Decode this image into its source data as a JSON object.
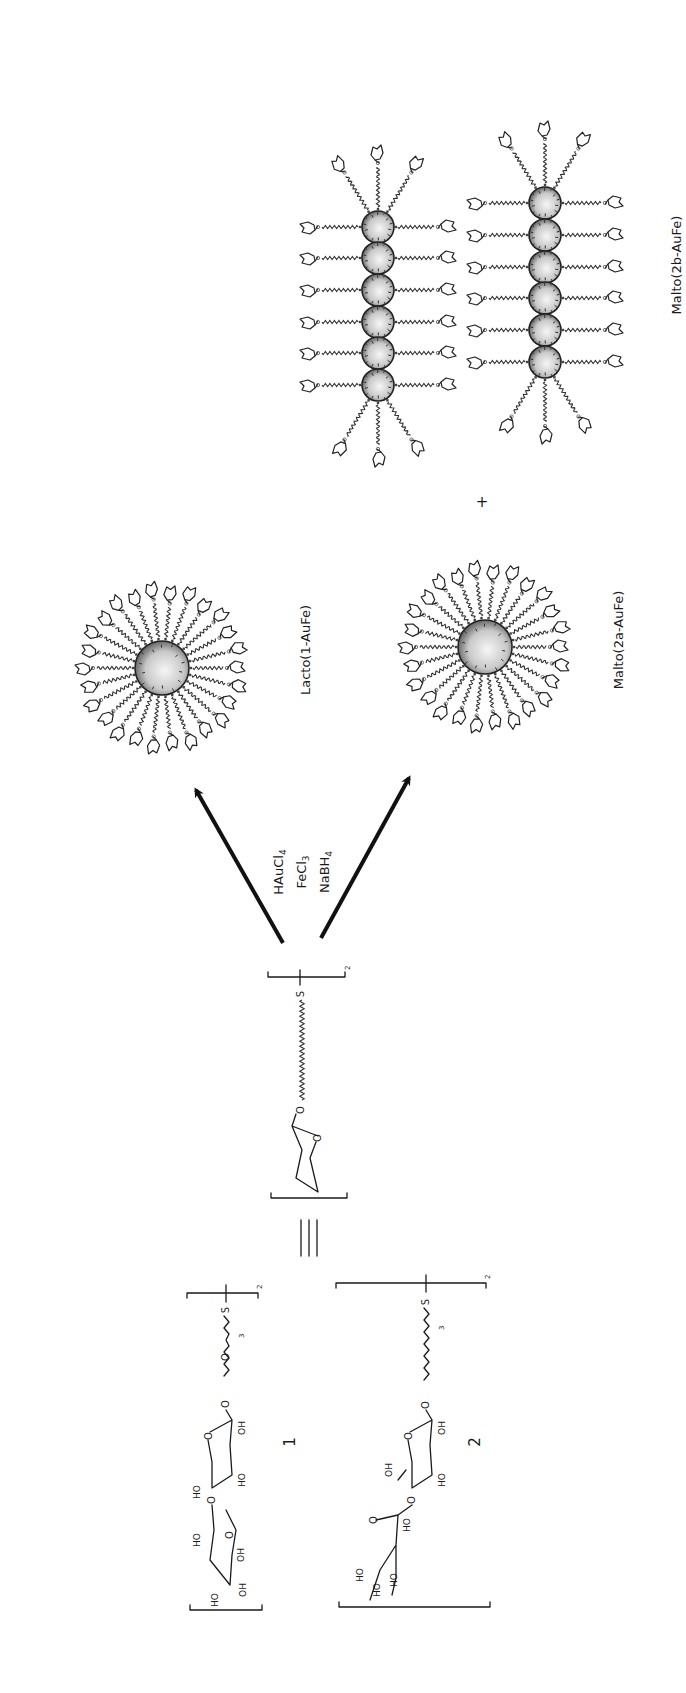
{
  "figure": {
    "orientation": "rotated-90-ccw",
    "reagents": [
      "HAuCl",
      "FeCl",
      "NaBH"
    ],
    "reagent_subscripts": [
      "4",
      "3",
      "4"
    ],
    "equivalence_symbol": "≡",
    "plus_sign": "+",
    "ligand_repeat_subscript": "2",
    "sulfur_atom": "S",
    "oxygen_atom": "O"
  },
  "compounds": [
    {
      "id": "1",
      "label": "1",
      "repeat_subscript": "3",
      "linker": "O-(CH2CH2O)3-CH2CH2-S",
      "sugar": "lactose",
      "hydroxyls": [
        "HO",
        "OH",
        "OH",
        "HO",
        "HO",
        "OH",
        "HO",
        "OH"
      ]
    },
    {
      "id": "2",
      "label": "2",
      "repeat_subscript": "3",
      "linker": "O-(CH2)n-S",
      "sugar": "maltose",
      "hydroxyls": [
        "HO",
        "HO",
        "HO",
        "HO",
        "OH",
        "HO",
        "OH"
      ]
    }
  ],
  "products": [
    {
      "id": "lacto",
      "label": "Lacto(1-AuFe)",
      "type": "single-nanoparticle"
    },
    {
      "id": "malto-2a",
      "label": "Malto(2a-AuFe)",
      "type": "single-nanoparticle"
    },
    {
      "id": "malto-2b",
      "label": "Malto(2b-AuFe)",
      "type": "nanoparticle-chains",
      "chains": 2,
      "particles_per_chain": 6
    }
  ],
  "colors": {
    "ink": "#1a1a1a",
    "particle_light": "#f4f4f4",
    "particle_dark": "#555555",
    "background": "#ffffff"
  }
}
